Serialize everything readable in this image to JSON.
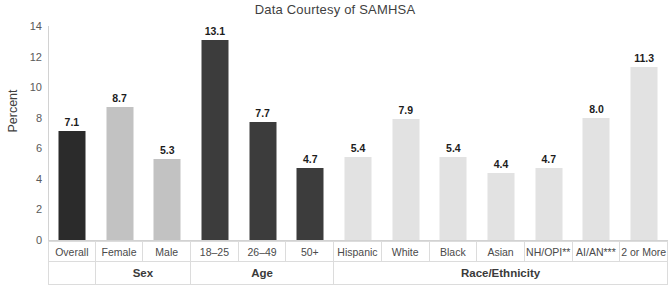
{
  "chart_data": {
    "type": "bar",
    "title": "Data Courtesy of SAMHSA",
    "xlabel": "",
    "ylabel": "Percent",
    "ylim": [
      0,
      14
    ],
    "yticks": [
      0,
      2,
      4,
      6,
      8,
      10,
      12,
      14
    ],
    "grid": false,
    "legend": "none",
    "categories": [
      "Overall",
      "Female",
      "Male",
      "18–25",
      "26–49",
      "50+",
      "Hispanic",
      "White",
      "Black",
      "Asian",
      "NH/OPI**",
      "AI/AN***",
      "2 or More"
    ],
    "values": [
      7.1,
      8.7,
      5.3,
      13.1,
      7.7,
      4.7,
      5.4,
      7.9,
      5.4,
      4.4,
      4.7,
      8.0,
      11.3
    ],
    "value_labels": [
      "7.1",
      "8.7",
      "5.3",
      "13.1",
      "7.7",
      "4.7",
      "5.4",
      "7.9",
      "5.4",
      "4.4",
      "4.7",
      "8.0",
      "11.3"
    ],
    "bar_colors": [
      "#2b2b2b",
      "#c2c2c2",
      "#c2c2c2",
      "#3c3c3c",
      "#3c3c3c",
      "#3c3c3c",
      "#e2e2e2",
      "#e2e2e2",
      "#e2e2e2",
      "#e2e2e2",
      "#e2e2e2",
      "#e2e2e2",
      "#e2e2e2"
    ],
    "groups": [
      {
        "label": "",
        "span": 1
      },
      {
        "label": "Sex",
        "span": 2
      },
      {
        "label": "Age",
        "span": 3
      },
      {
        "label": "Race/Ethnicity",
        "span": 7
      }
    ],
    "colors": {
      "axis": "#d2d2d2",
      "grid_line": "#dcdcdc",
      "tick_text": "#5a5a5a",
      "title_text": "#3f3f3f",
      "value_text": "#1c1c1c",
      "background": "#ffffff"
    }
  }
}
